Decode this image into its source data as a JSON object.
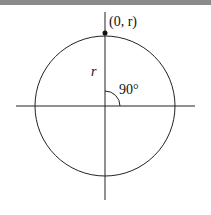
{
  "diagram": {
    "point_label": "(0, r)",
    "radius_label": "r",
    "angle_label": "90°",
    "colors": {
      "stroke": "#222222",
      "topbar": "#8a8a8a"
    }
  }
}
